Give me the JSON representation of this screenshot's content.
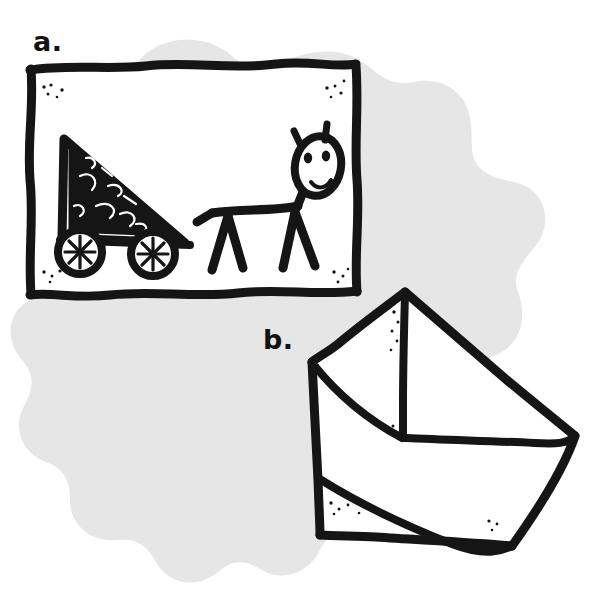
{
  "figure": {
    "caption_kind": "two-panel hand-drawn illustration",
    "background_color": "#ffffff",
    "ink_color": "#151515",
    "blob_color": "#e6e6e6",
    "panels": [
      {
        "id": "a",
        "label": "a.",
        "label_x": 33,
        "label_y": 28,
        "subject": "framed drawing of a horse pulling a triangular cart",
        "frame": {
          "name": "picture-frame",
          "x": 28,
          "y": 64,
          "width": 328,
          "height": 228,
          "stroke_width": 9
        },
        "contents": [
          {
            "name": "cart",
            "shape": "filled-triangle-wagon"
          },
          {
            "name": "cart-wheel-left",
            "cx": 80,
            "cy": 237,
            "r": 22
          },
          {
            "name": "cart-wheel-right",
            "cx": 150,
            "cy": 237,
            "r": 22
          },
          {
            "name": "horse",
            "shape": "stick-figure-animal"
          },
          {
            "name": "horse-head",
            "cx": 315,
            "cy": 165
          },
          {
            "name": "horse-eye-left",
            "cx": 305,
            "cy": 155
          },
          {
            "name": "horse-eye-right",
            "cx": 321,
            "cy": 153
          },
          {
            "name": "horse-mouth",
            "shape": "smile"
          },
          {
            "name": "horse-ear-left",
            "x": 297,
            "y": 139
          },
          {
            "name": "horse-ear-right",
            "x": 322,
            "y": 135
          }
        ]
      },
      {
        "id": "b",
        "label": "b.",
        "label_x": 263,
        "label_y": 326,
        "subject": "envelope drawn at a tilted angle",
        "vertices": {
          "apex_top": [
            405,
            292
          ],
          "left": [
            312,
            362
          ],
          "right": [
            575,
            435
          ],
          "bottom_right": [
            512,
            545
          ],
          "bottom_left": [
            320,
            535
          ]
        },
        "flap_fold_point": [
          403,
          437
        ],
        "stroke_width": 9
      }
    ],
    "speckles": {
      "name": "ink-speckles",
      "description": "small ink dots near corners of the frame and envelope"
    }
  }
}
